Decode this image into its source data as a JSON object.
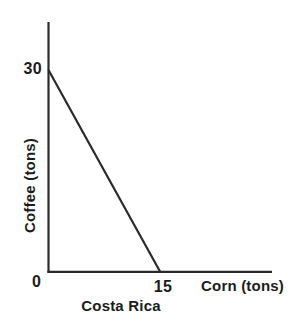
{
  "chart_data": {
    "type": "line",
    "title": "",
    "caption": "Costa Rica",
    "xlabel": "Corn (tons)",
    "ylabel": "Coffee (tons)",
    "xlim": [
      0,
      24
    ],
    "ylim": [
      0,
      33
    ],
    "grid": false,
    "legend": "none",
    "x_tick_labels": [
      "0",
      "15"
    ],
    "y_tick_labels": [
      "0",
      "30"
    ],
    "x_ticks": [
      0,
      15
    ],
    "y_ticks": [
      0,
      30
    ],
    "series": [
      {
        "name": "Production possibilities frontier",
        "x": [
          0,
          15
        ],
        "y": [
          30,
          0
        ],
        "color": "#2a2a2a"
      }
    ],
    "annotations": []
  },
  "axes": {
    "y_tick_30": "30",
    "origin_label": "0",
    "x_tick_15": "15",
    "x_title": "Corn (tons)",
    "y_title": "Coffee (tons)"
  },
  "caption": {
    "text": "Costa Rica"
  },
  "colors": {
    "axis": "#2a2a2a",
    "line": "#2a2a2a",
    "text": "#1c1c1c",
    "background": "#ffffff"
  }
}
